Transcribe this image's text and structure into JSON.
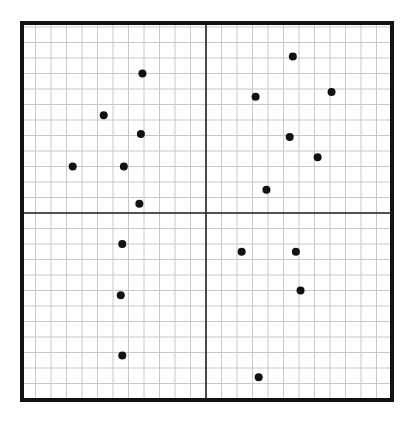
{
  "chart_data": {
    "type": "scatter",
    "title": "",
    "xlabel": "",
    "ylabel": "",
    "grid": true,
    "xlim": [
      -12,
      12
    ],
    "ylim": [
      -12,
      12
    ],
    "grid_step": 1,
    "axes_through_origin": true,
    "points": [
      {
        "x": -4.1,
        "y": 9.0
      },
      {
        "x": -6.6,
        "y": 6.3
      },
      {
        "x": -4.2,
        "y": 5.1
      },
      {
        "x": -8.6,
        "y": 3.0
      },
      {
        "x": -5.3,
        "y": 3.0
      },
      {
        "x": -4.3,
        "y": 0.6
      },
      {
        "x": 5.6,
        "y": 10.1
      },
      {
        "x": 3.2,
        "y": 7.5
      },
      {
        "x": 8.1,
        "y": 7.8
      },
      {
        "x": 5.4,
        "y": 4.9
      },
      {
        "x": 7.2,
        "y": 3.6
      },
      {
        "x": 3.9,
        "y": 1.5
      },
      {
        "x": -5.4,
        "y": -2.0
      },
      {
        "x": -5.5,
        "y": -5.3
      },
      {
        "x": -5.4,
        "y": -9.2
      },
      {
        "x": 2.3,
        "y": -2.5
      },
      {
        "x": 5.8,
        "y": -2.5
      },
      {
        "x": 6.1,
        "y": -5.0
      },
      {
        "x": 3.4,
        "y": -10.6
      }
    ]
  },
  "colors": {
    "grid": "#c8c8c8",
    "axis": "#222222",
    "border": "#111111",
    "point": "#111111"
  },
  "layout": {
    "left": 22,
    "top": 23,
    "right": 392,
    "bottom": 400,
    "cx": 206,
    "cy": 213,
    "unit": 15.5
  }
}
